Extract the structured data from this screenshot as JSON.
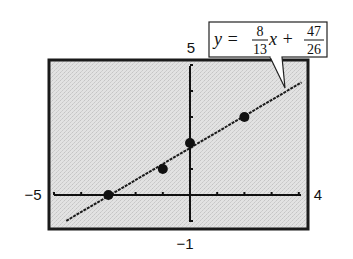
{
  "chart_data": {
    "type": "scatter",
    "title": "",
    "xlabel": "",
    "ylabel": "",
    "xlim": [
      -5,
      4
    ],
    "ylim": [
      -1,
      5
    ],
    "grid": false,
    "axis_labels": {
      "xmin": "−5",
      "xmax": "4",
      "ymin": "−1",
      "ymax": "5"
    },
    "x_ticks": [
      -5,
      -4,
      -3,
      -2,
      -1,
      0,
      1,
      2,
      3,
      4
    ],
    "y_ticks": [
      -1,
      0,
      1,
      2,
      3,
      4,
      5
    ],
    "points": [
      {
        "x": -3,
        "y": 0
      },
      {
        "x": -1,
        "y": 1
      },
      {
        "x": 0,
        "y": 2
      },
      {
        "x": 2,
        "y": 3
      }
    ],
    "series": [
      {
        "name": "regression line",
        "kind": "line",
        "slope": 0.6153846,
        "intercept": 1.8076923,
        "x_range": [
          -4.55,
          4.1
        ]
      }
    ],
    "annotation": {
      "text": "y = 8/13 x + 47/26",
      "lhs": "y =",
      "slope_num": "8",
      "slope_den": "13",
      "var": "x +",
      "int_num": "47",
      "int_den": "26"
    },
    "colors": {
      "plot_background": "#dcdcdc",
      "frame": "#1a1a1a",
      "line": "#1a1a1a",
      "points": "#111111"
    }
  }
}
